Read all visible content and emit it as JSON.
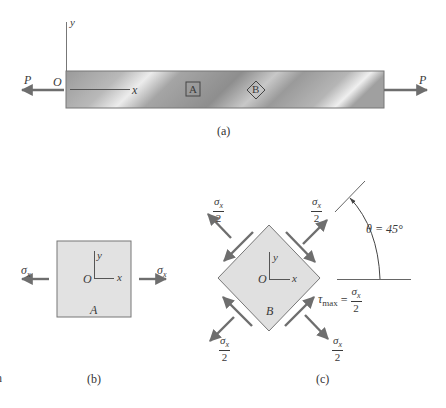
{
  "figure_a": {
    "caption": "(a)",
    "axis_y": "y",
    "axis_x": "x",
    "origin": "O",
    "load_left": "P",
    "load_right": "P",
    "element_a_label": "A",
    "element_b_label": "B"
  },
  "figure_b": {
    "caption": "(b)",
    "axis_y": "y",
    "axis_x": "x",
    "origin": "O",
    "element_label": "A",
    "stress_left": "σ",
    "stress_left_sub": "x",
    "stress_right": "σ",
    "stress_right_sub": "x"
  },
  "figure_c": {
    "caption": "(c)",
    "axis_y": "y",
    "axis_x": "x",
    "origin": "O",
    "element_label": "B",
    "normal_stress_num": "σ",
    "normal_stress_sub": "x",
    "normal_stress_den": "2",
    "tau_label": "τ",
    "tau_sub": "max",
    "tau_eq": "=",
    "tau_num": "σ",
    "tau_num_sub": "x",
    "tau_den": "2",
    "angle_label": "θ = 45°"
  },
  "edge_fragment": "n",
  "colors": {
    "bar_dark": "#8a8a8a",
    "bar_light": "#e6e6e6",
    "element_fill": "#dedede",
    "arrow": "#6e6e6e",
    "line": "#555555"
  }
}
